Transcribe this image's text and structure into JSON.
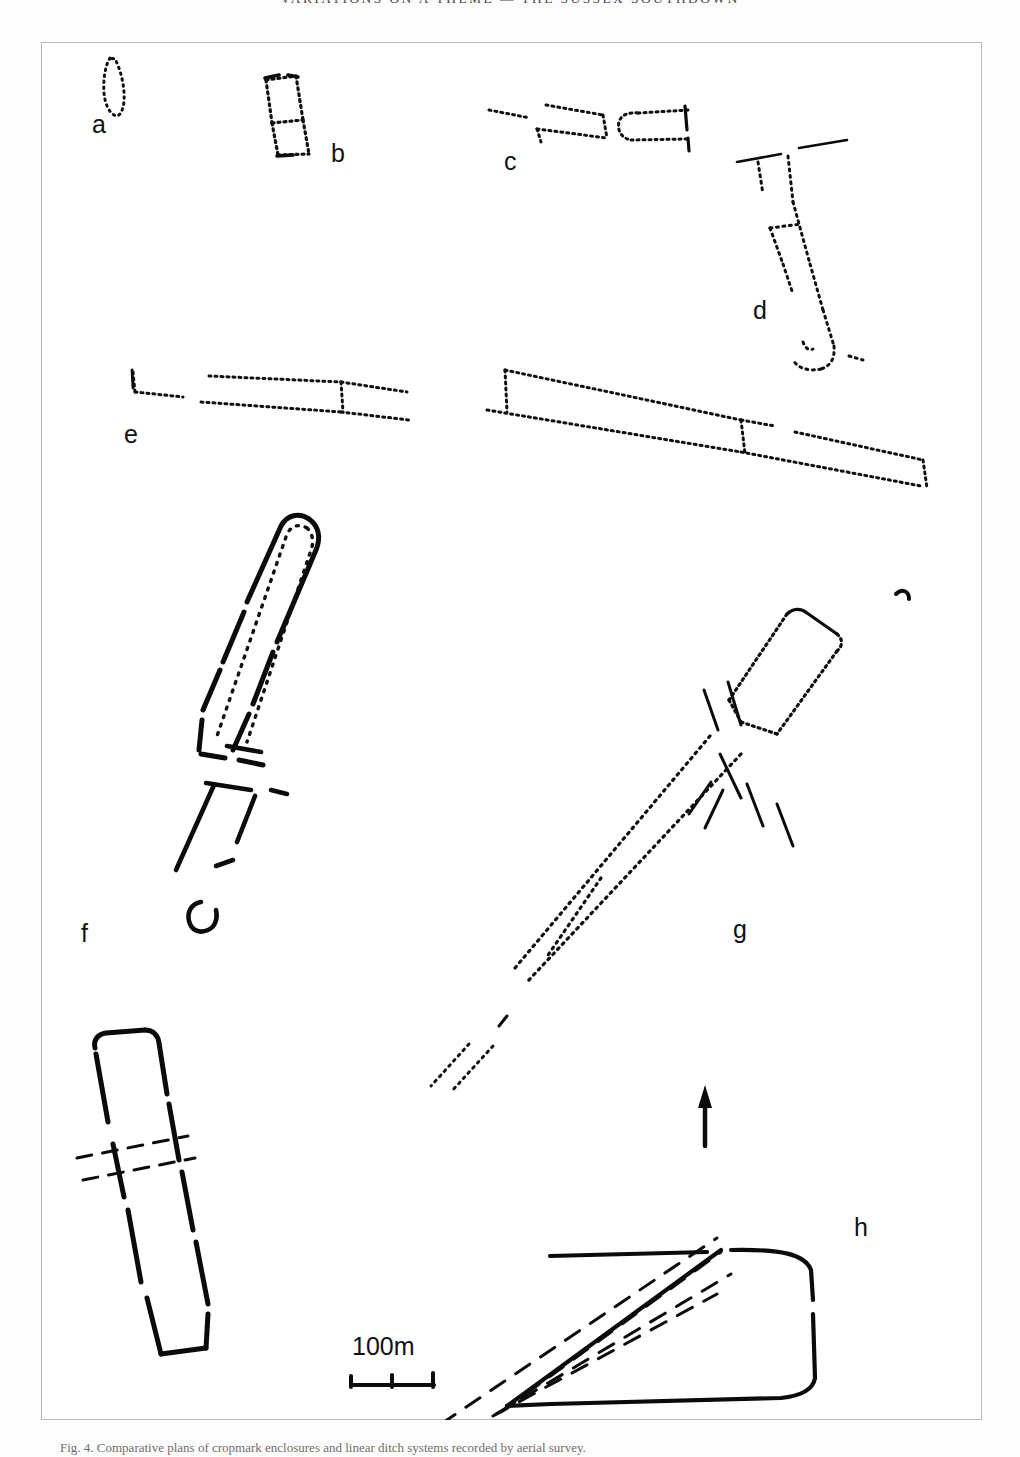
{
  "page": {
    "running_header": "VARIATIONS ON A THEME — THE SUSSEX SOUTHDOWN",
    "caption": "Fig. 4. Comparative plans of cropmark enclosures and linear ditch systems recorded by aerial survey."
  },
  "figure": {
    "north_arrow_label": "N",
    "scale": {
      "label": "100m",
      "length_m": 100,
      "divisions": 2
    },
    "plans": [
      {
        "key": "a",
        "label": "a",
        "label_x": 51,
        "label_y": 91,
        "description": "small narrow sub-oval cropmark enclosure, dotted outline",
        "line_style": "dotted"
      },
      {
        "key": "b",
        "label": "b",
        "label_x": 290,
        "label_y": 120,
        "description": "twin-celled rectangular enclosure, dotted outline with internal cross division",
        "line_style": "dotted"
      },
      {
        "key": "c",
        "label": "c",
        "label_x": 463,
        "label_y": 128,
        "description": "fragmentary rectilinear enclosure with open western side and detached ditch lengths",
        "line_style": "dotted"
      },
      {
        "key": "d",
        "label": "d",
        "label_x": 712,
        "label_y": 277,
        "description": "elongated funnel-shaped enclosure with transverse division and dashed field boundaries at north",
        "line_style": "dotted"
      },
      {
        "key": "e",
        "label": "e",
        "label_x": 83,
        "label_y": 401,
        "description": "long double-ditched linear trackway with cross banks, two surviving segments",
        "line_style": "dotted"
      },
      {
        "key": "f",
        "label": "f",
        "label_x": 40,
        "label_y": 900,
        "description": "long barrow-like enclosure with solid bank line and dotted inner ditch, plus detached rectangular enclosure crossed by dashed lines",
        "line_style": "solid-and-dotted"
      },
      {
        "key": "g",
        "label": "g",
        "label_x": 692,
        "label_y": 896,
        "description": "long diagonal linear ditch with terminal rectangular enclosure and dashed cross features",
        "line_style": "dotted"
      },
      {
        "key": "h",
        "label": "h",
        "label_x": 813,
        "label_y": 1194,
        "description": "wedge-shaped enclosure with rounded eastern end and converging dashed boundary ditches",
        "line_style": "solid"
      }
    ]
  },
  "colors": {
    "ink": "#0b0b0b",
    "frame": "#b9b9b9",
    "paper": "#ffffff",
    "header_text": "#4a4a4a"
  }
}
